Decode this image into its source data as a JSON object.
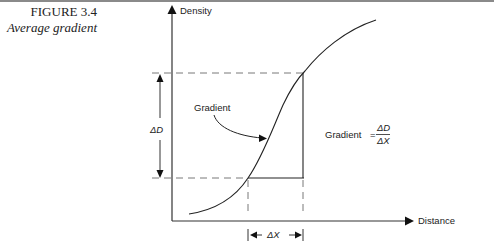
{
  "figure": {
    "number": "FIGURE 3.4",
    "title": "Average gradient"
  },
  "diagram": {
    "y_axis_label": "Density",
    "x_axis_label": "Distance",
    "curve_label": "Gradient",
    "delta_d_label": "ΔD",
    "delta_x_label": "ΔX",
    "formula": {
      "lhs": "Gradient",
      "equals": "=",
      "numerator": "ΔD",
      "denominator": "ΔX"
    }
  }
}
